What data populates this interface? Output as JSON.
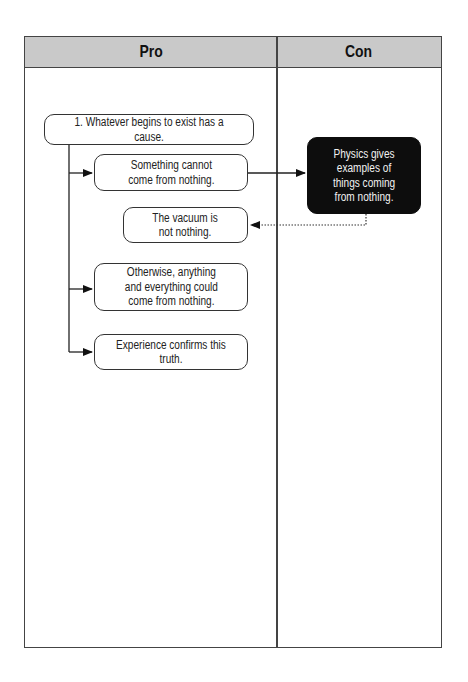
{
  "table": {
    "columns": [
      {
        "label": "Pro"
      },
      {
        "label": "Con"
      }
    ]
  },
  "diagram": {
    "claim": "1. Whatever begins to exist has a cause.",
    "pro_nodes": [
      {
        "id": "something-cannot",
        "text": "Something cannot\ncome from nothing."
      },
      {
        "id": "vacuum",
        "text": "The vacuum is\nnot nothing."
      },
      {
        "id": "otherwise",
        "text": "Otherwise, anything\nand everything could\ncome from nothing."
      },
      {
        "id": "experience",
        "text": "Experience confirms this truth."
      }
    ],
    "con_nodes": [
      {
        "id": "physics",
        "text": "Physics gives\nexamples of\nthings coming\nfrom nothing."
      }
    ],
    "edges": [
      {
        "from": "claim",
        "to": "something-cannot",
        "style": "solid"
      },
      {
        "from": "claim",
        "to": "otherwise",
        "style": "solid"
      },
      {
        "from": "claim",
        "to": "experience",
        "style": "solid"
      },
      {
        "from": "something-cannot",
        "to": "physics",
        "style": "solid"
      },
      {
        "from": "physics",
        "to": "vacuum",
        "style": "dotted"
      }
    ]
  },
  "colors": {
    "header_bg": "#c9c9c9",
    "border": "#444444",
    "dark_box": "#0d0d0d"
  }
}
